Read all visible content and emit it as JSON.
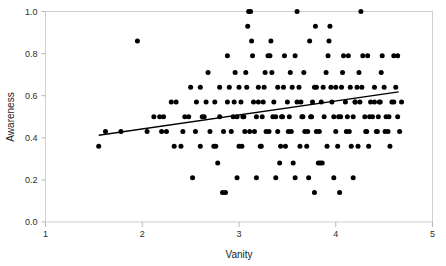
{
  "chart_data": {
    "type": "scatter",
    "title": "",
    "xlabel": "Vanity",
    "ylabel": "Awareness",
    "xlim": [
      1,
      5
    ],
    "ylim": [
      0.0,
      1.0
    ],
    "grid": false,
    "legend": null,
    "x_ticks": [
      1,
      2,
      3,
      4,
      5
    ],
    "x_tick_labels": [
      "1",
      "2",
      "3",
      "4",
      "5"
    ],
    "y_ticks": [
      0.0,
      0.2,
      0.4,
      0.6,
      0.8,
      1.0
    ],
    "y_tick_labels": [
      "0.0",
      "0.2",
      "0.4",
      "0.6",
      "0.8",
      "1.0"
    ],
    "marker": "filled-circle",
    "marker_color": "#000000",
    "marker_size_px": 5,
    "trend_line": {
      "type": "linear-fit",
      "color": "#000000",
      "x_start": 1.55,
      "y_start": 0.412,
      "x_end": 4.65,
      "y_end": 0.618
    },
    "points": [
      [
        1.55,
        0.36
      ],
      [
        1.62,
        0.43
      ],
      [
        1.78,
        0.43
      ],
      [
        1.95,
        0.86
      ],
      [
        2.05,
        0.43
      ],
      [
        2.12,
        0.5
      ],
      [
        2.18,
        0.5
      ],
      [
        2.25,
        0.43
      ],
      [
        2.3,
        0.57
      ],
      [
        2.33,
        0.36
      ],
      [
        2.4,
        0.36
      ],
      [
        2.48,
        0.5
      ],
      [
        2.52,
        0.21
      ],
      [
        2.56,
        0.57
      ],
      [
        2.6,
        0.64
      ],
      [
        2.62,
        0.5
      ],
      [
        2.66,
        0.57
      ],
      [
        2.7,
        0.43
      ],
      [
        2.74,
        0.36
      ],
      [
        2.76,
        0.36
      ],
      [
        2.78,
        0.28
      ],
      [
        2.8,
        0.5
      ],
      [
        2.83,
        0.14
      ],
      [
        2.86,
        0.14
      ],
      [
        2.88,
        0.57
      ],
      [
        2.9,
        0.64
      ],
      [
        2.92,
        0.43
      ],
      [
        2.94,
        0.5
      ],
      [
        2.96,
        0.71
      ],
      [
        2.98,
        0.5
      ],
      [
        3.0,
        0.36
      ],
      [
        3.02,
        0.57
      ],
      [
        3.04,
        0.5
      ],
      [
        3.06,
        0.43
      ],
      [
        3.08,
        0.64
      ],
      [
        3.1,
        1.0
      ],
      [
        3.12,
        1.0
      ],
      [
        3.14,
        0.79
      ],
      [
        3.16,
        0.43
      ],
      [
        3.18,
        0.5
      ],
      [
        3.2,
        0.57
      ],
      [
        3.22,
        0.36
      ],
      [
        3.24,
        0.5
      ],
      [
        3.26,
        0.64
      ],
      [
        3.28,
        0.43
      ],
      [
        3.3,
        0.79
      ],
      [
        3.32,
        0.79
      ],
      [
        3.34,
        0.71
      ],
      [
        3.36,
        0.57
      ],
      [
        3.38,
        0.5
      ],
      [
        3.4,
        0.43
      ],
      [
        3.42,
        0.28
      ],
      [
        3.44,
        0.5
      ],
      [
        3.46,
        0.64
      ],
      [
        3.48,
        0.36
      ],
      [
        3.5,
        0.57
      ],
      [
        3.52,
        0.5
      ],
      [
        3.54,
        0.43
      ],
      [
        3.56,
        0.28
      ],
      [
        3.58,
        0.79
      ],
      [
        3.6,
        1.0
      ],
      [
        3.62,
        0.64
      ],
      [
        3.64,
        0.57
      ],
      [
        3.66,
        0.5
      ],
      [
        3.68,
        0.43
      ],
      [
        3.7,
        0.36
      ],
      [
        3.72,
        0.21
      ],
      [
        3.74,
        0.5
      ],
      [
        3.76,
        0.57
      ],
      [
        3.78,
        0.64
      ],
      [
        3.8,
        0.43
      ],
      [
        3.82,
        0.28
      ],
      [
        3.84,
        0.28
      ],
      [
        3.86,
        0.28
      ],
      [
        3.88,
        0.5
      ],
      [
        3.9,
        0.71
      ],
      [
        3.92,
        0.79
      ],
      [
        3.94,
        0.93
      ],
      [
        3.96,
        0.57
      ],
      [
        3.98,
        0.5
      ],
      [
        4.0,
        0.43
      ],
      [
        4.02,
        0.36
      ],
      [
        4.04,
        0.14
      ],
      [
        4.06,
        0.64
      ],
      [
        4.08,
        0.79
      ],
      [
        4.1,
        0.57
      ],
      [
        4.12,
        0.5
      ],
      [
        4.14,
        0.43
      ],
      [
        4.16,
        0.36
      ],
      [
        4.18,
        0.5
      ],
      [
        4.2,
        0.57
      ],
      [
        4.22,
        0.64
      ],
      [
        4.24,
        0.71
      ],
      [
        4.26,
        1.0
      ],
      [
        4.28,
        0.79
      ],
      [
        4.3,
        0.5
      ],
      [
        4.32,
        0.43
      ],
      [
        4.34,
        0.36
      ],
      [
        4.36,
        0.57
      ],
      [
        4.38,
        0.5
      ],
      [
        4.4,
        0.64
      ],
      [
        4.42,
        0.43
      ],
      [
        4.44,
        0.5
      ],
      [
        4.46,
        0.57
      ],
      [
        4.48,
        0.79
      ],
      [
        4.5,
        0.64
      ],
      [
        4.52,
        0.5
      ],
      [
        4.54,
        0.43
      ],
      [
        4.56,
        0.36
      ],
      [
        4.58,
        0.57
      ],
      [
        4.6,
        0.79
      ],
      [
        4.62,
        0.64
      ],
      [
        4.64,
        0.5
      ],
      [
        4.66,
        0.43
      ],
      [
        2.2,
        0.43
      ],
      [
        2.44,
        0.5
      ],
      [
        2.64,
        0.5
      ],
      [
        2.84,
        0.43
      ],
      [
        3.05,
        0.5
      ],
      [
        3.25,
        0.57
      ],
      [
        3.45,
        0.5
      ],
      [
        3.65,
        0.5
      ],
      [
        3.85,
        0.57
      ],
      [
        4.05,
        0.5
      ],
      [
        4.25,
        0.57
      ],
      [
        4.45,
        0.57
      ],
      [
        2.35,
        0.57
      ],
      [
        2.55,
        0.43
      ],
      [
        2.75,
        0.57
      ],
      [
        2.95,
        0.57
      ],
      [
        3.15,
        0.57
      ],
      [
        3.35,
        0.5
      ],
      [
        3.55,
        0.64
      ],
      [
        3.75,
        0.5
      ],
      [
        3.95,
        0.64
      ],
      [
        4.15,
        0.64
      ],
      [
        4.35,
        0.5
      ],
      [
        4.55,
        0.5
      ],
      [
        3.07,
        0.71
      ],
      [
        3.27,
        0.71
      ],
      [
        3.47,
        0.79
      ],
      [
        3.67,
        0.71
      ],
      [
        3.87,
        0.64
      ],
      [
        4.07,
        0.71
      ],
      [
        4.27,
        0.64
      ],
      [
        4.47,
        0.71
      ],
      [
        2.68,
        0.71
      ],
      [
        2.88,
        0.79
      ],
      [
        3.13,
        0.86
      ],
      [
        3.33,
        0.86
      ],
      [
        3.53,
        0.71
      ],
      [
        3.73,
        0.86
      ],
      [
        3.93,
        0.86
      ],
      [
        4.13,
        0.79
      ],
      [
        4.33,
        0.79
      ],
      [
        3.03,
        0.36
      ],
      [
        3.23,
        0.36
      ],
      [
        3.43,
        0.36
      ],
      [
        3.63,
        0.36
      ],
      [
        3.83,
        0.43
      ],
      [
        4.03,
        0.5
      ],
      [
        4.23,
        0.36
      ],
      [
        4.43,
        0.43
      ],
      [
        2.98,
        0.21
      ],
      [
        3.18,
        0.21
      ],
      [
        3.38,
        0.21
      ],
      [
        3.58,
        0.21
      ],
      [
        3.78,
        0.14
      ],
      [
        3.98,
        0.21
      ],
      [
        4.18,
        0.21
      ],
      [
        2.6,
        0.36
      ],
      [
        2.8,
        0.64
      ],
      [
        3.0,
        0.64
      ],
      [
        3.2,
        0.64
      ],
      [
        3.4,
        0.64
      ],
      [
        3.6,
        0.57
      ],
      [
        3.8,
        0.64
      ],
      [
        4.0,
        0.64
      ],
      [
        4.2,
        0.57
      ],
      [
        4.4,
        0.57
      ],
      [
        4.6,
        0.57
      ],
      [
        2.5,
        0.64
      ],
      [
        3.09,
        0.93
      ],
      [
        3.79,
        0.93
      ],
      [
        2.42,
        0.43
      ],
      [
        2.22,
        0.5
      ],
      [
        4.64,
        0.79
      ],
      [
        4.68,
        0.57
      ],
      [
        3.11,
        0.43
      ],
      [
        3.31,
        0.43
      ],
      [
        3.51,
        0.43
      ],
      [
        3.71,
        0.43
      ],
      [
        3.91,
        0.36
      ],
      [
        4.11,
        0.43
      ],
      [
        4.31,
        0.43
      ],
      [
        4.51,
        0.43
      ]
    ]
  }
}
